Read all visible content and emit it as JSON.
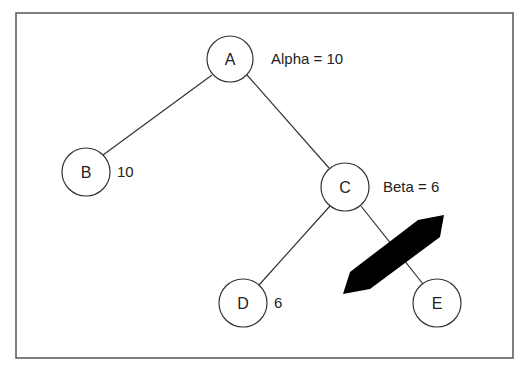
{
  "diagram": {
    "type": "game-tree-alpha-beta-pruning",
    "nodes": [
      {
        "id": "A",
        "label": "A",
        "annotation": "Alpha = 10",
        "cx": 230,
        "cy": 59
      },
      {
        "id": "B",
        "label": "B",
        "annotation": "10",
        "cx": 86,
        "cy": 172
      },
      {
        "id": "C",
        "label": "C",
        "annotation": "Beta = 6",
        "cx": 345,
        "cy": 187
      },
      {
        "id": "D",
        "label": "D",
        "annotation": "6",
        "cx": 243,
        "cy": 303
      },
      {
        "id": "E",
        "label": "E",
        "annotation": "",
        "cx": 437,
        "cy": 303
      }
    ],
    "edges": [
      {
        "from": "A",
        "to": "B"
      },
      {
        "from": "A",
        "to": "C"
      },
      {
        "from": "C",
        "to": "D"
      },
      {
        "from": "C",
        "to": "E",
        "pruned": true
      }
    ],
    "prune_marker": "pruned-branch-cut",
    "colors": {
      "stroke": "#333333",
      "fill": "#ffffff",
      "marker": "#000000",
      "frame": "#555555"
    }
  }
}
